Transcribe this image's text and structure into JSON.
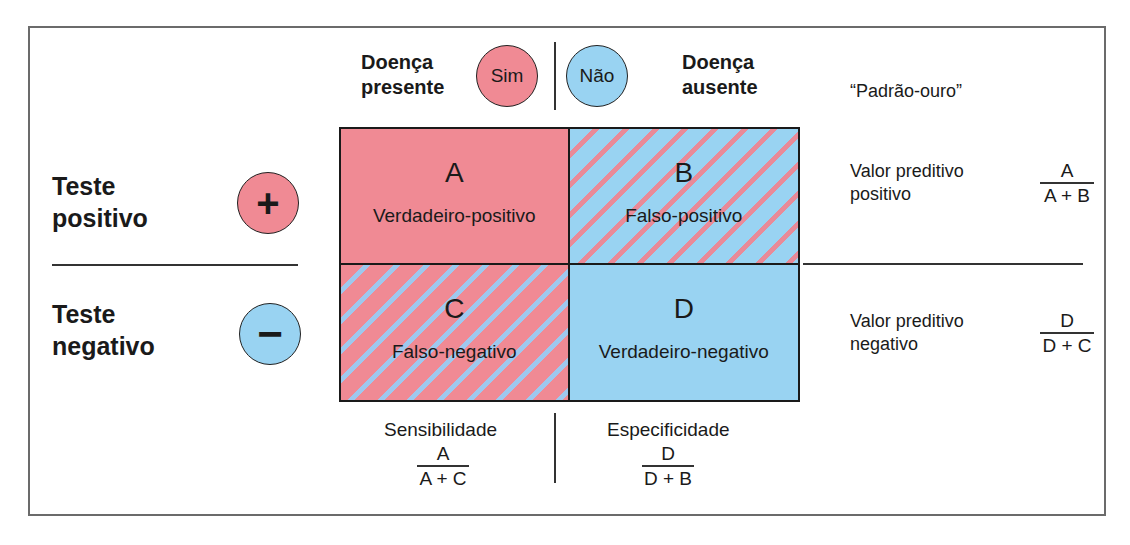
{
  "header": {
    "disease_present": [
      "Doença",
      "presente"
    ],
    "disease_absent": [
      "Doença",
      "ausente"
    ],
    "yes_circle": "Sim",
    "no_circle": "Não",
    "gold_standard": "“Padrão-ouro”"
  },
  "rows": {
    "positive": {
      "label": [
        "Teste",
        "positivo"
      ],
      "symbol": "+"
    },
    "negative": {
      "label": [
        "Teste",
        "negativo"
      ],
      "symbol": "−"
    }
  },
  "cells": [
    {
      "letter": "A",
      "label": "Verdadeiro-positivo"
    },
    {
      "letter": "B",
      "label": "Falso-positivo"
    },
    {
      "letter": "C",
      "label": "Falso-negativo"
    },
    {
      "letter": "D",
      "label": "Verdadeiro-negativo"
    }
  ],
  "predictive": {
    "positive": {
      "label": [
        "Valor preditivo",
        "positivo"
      ],
      "num": "A",
      "den": "A + B"
    },
    "negative": {
      "label": [
        "Valor preditivo",
        "negativo"
      ],
      "num": "D",
      "den": "D + C"
    }
  },
  "bottom": {
    "sensitivity": {
      "label": "Sensibilidade",
      "num": "A",
      "den": "A + C"
    },
    "specificity": {
      "label": "Especificidade",
      "num": "D",
      "den": "D + B"
    }
  },
  "colors": {
    "pink": "#f08a94",
    "blue": "#99d3f2",
    "border": "#1a1a1a"
  }
}
